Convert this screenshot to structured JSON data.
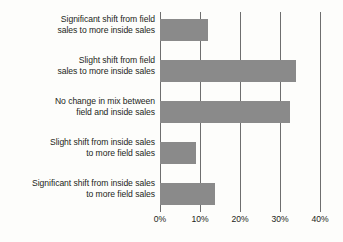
{
  "chart_data": {
    "type": "bar",
    "orientation": "horizontal",
    "title": "",
    "subtitle": "",
    "xlabel": "",
    "ylabel": "",
    "categories": [
      "Significant shift from field\nsales to more inside sales",
      "Slight shift from field\nsales to more inside sales",
      "No change in mix between\nfield and inside sales",
      "Slight shift from inside sales\nto more field sales",
      "Significant shift from inside sales\nto more field sales"
    ],
    "values": [
      12,
      34,
      32.5,
      9,
      13.7
    ],
    "value_unit": "%",
    "xlim": [
      0,
      40
    ],
    "xticks": [
      0,
      10,
      20,
      30,
      40
    ],
    "xtick_labels": [
      "0%",
      "10%",
      "20%",
      "30%",
      "40%"
    ],
    "grid": true,
    "grid_axis": "x",
    "legend": false,
    "legend_position": "none",
    "colors": {
      "bar_fill": "#8a8a8a",
      "gridline": "#6e6e6e",
      "axis": "#6e6e6e",
      "text": "#231f20",
      "background": "#fdfdfb"
    }
  }
}
